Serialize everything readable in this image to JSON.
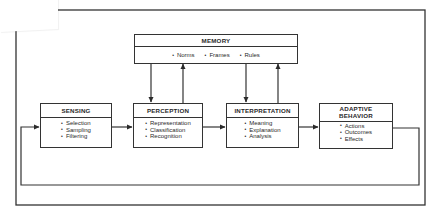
{
  "diagram": {
    "type": "flow-diagram",
    "colors": {
      "stroke": "#333333",
      "background": "#ffffff",
      "text": "#2a2a2a"
    },
    "memory": {
      "title": "MEMORY",
      "items": [
        "Norms",
        "Frames",
        "Rules"
      ]
    },
    "stages": [
      {
        "id": "sensing",
        "title": "SENSING",
        "items": [
          "Selection",
          "Sampling",
          "Filtering"
        ]
      },
      {
        "id": "perception",
        "title": "PERCEPTION",
        "items": [
          "Representation",
          "Classification",
          "Recognition"
        ]
      },
      {
        "id": "interpretation",
        "title": "INTERPRETATION",
        "items": [
          "Meaning",
          "Explanation",
          "Analysis"
        ]
      },
      {
        "id": "adaptive-behavior",
        "title_line1": "ADAPTIVE",
        "title_line2": "BEHAVIOR",
        "items": [
          "Actions",
          "Outcomes",
          "Effects"
        ]
      }
    ],
    "edges": [
      {
        "from": "sensing",
        "to": "perception"
      },
      {
        "from": "perception",
        "to": "interpretation"
      },
      {
        "from": "interpretation",
        "to": "adaptive-behavior"
      },
      {
        "from": "memory",
        "to": "perception"
      },
      {
        "from": "perception",
        "to": "memory"
      },
      {
        "from": "memory",
        "to": "interpretation"
      },
      {
        "from": "interpretation",
        "to": "memory"
      },
      {
        "from": "adaptive-behavior",
        "to": "sensing",
        "label": "feedback loop"
      }
    ]
  }
}
